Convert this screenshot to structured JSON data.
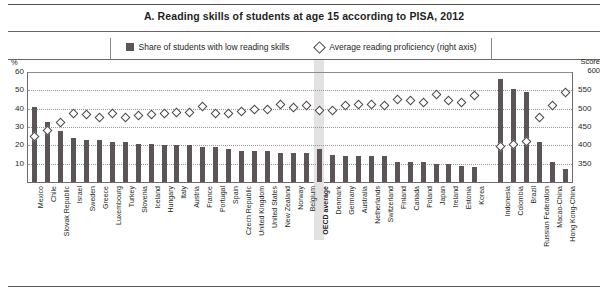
{
  "title": "A. Reading skills of students at age 15 according to PISA, 2012",
  "legend": {
    "bars_label": "Share of students with low reading skills",
    "markers_label": "Average reading proficiency (right axis)"
  },
  "axes": {
    "left_unit": "%",
    "right_unit_line1": "Score",
    "right_unit_line2": "600",
    "left_ticks": [
      "60",
      "50",
      "40",
      "30",
      "20",
      "10"
    ],
    "right_ticks": [
      "600",
      "550",
      "500",
      "450",
      "400",
      "350"
    ],
    "left_range": [
      0,
      60
    ],
    "right_range": [
      300,
      600
    ]
  },
  "colors": {
    "bar": "#5b5557",
    "marker_edge": "#4a4547",
    "marker_fill": "#ffffff",
    "grid": "#9b9698",
    "highlight_band": "#e3e1e2",
    "text": "#231f1e"
  },
  "chart_data": {
    "type": "bar",
    "title": "A. Reading skills of students at age 15 according to PISA, 2012",
    "xlabel": "",
    "ylabel": "%",
    "ylim": [
      0,
      60
    ],
    "y2label": "Score",
    "y2lim": [
      300,
      600
    ],
    "grid": true,
    "legend_position": "top",
    "highlight_category": "OECD average",
    "categories": [
      "Mexico",
      "Chile",
      "Slovak Republic",
      "Israel",
      "Sweden",
      "Greece",
      "Luxembourg",
      "Turkey",
      "Slovenia",
      "Iceland",
      "Hungary",
      "Italy",
      "Austria",
      "France",
      "Portugal",
      "Spain",
      "Czech Republic",
      "United Kingdom",
      "United States",
      "New Zealand",
      "Norway",
      "Belgium",
      "OECD average",
      "Denmark",
      "Germany",
      "Australia",
      "Netherlands",
      "Switzerland",
      "Finland",
      "Canada",
      "Poland",
      "Japan",
      "Ireland",
      "Estonia",
      "Korea",
      "",
      "Indonesia",
      "Colombia",
      "Brazil",
      "Russian Federation",
      "Macao-China",
      "Hong Kong-China"
    ],
    "series": [
      {
        "name": "Share of students with low reading skills",
        "type": "bar",
        "axis": "left",
        "values": [
          41,
          33,
          28,
          24,
          23,
          23,
          22,
          22,
          21,
          21,
          20,
          20,
          20,
          19,
          19,
          18,
          17,
          17,
          17,
          16,
          16,
          16,
          18,
          15,
          14,
          14,
          14,
          14,
          11,
          11,
          11,
          10,
          10,
          9,
          8,
          null,
          56,
          51,
          49,
          22,
          11,
          7
        ]
      },
      {
        "name": "Average reading proficiency (right axis)",
        "type": "scatter",
        "axis": "right",
        "values": [
          424,
          441,
          463,
          486,
          483,
          477,
          488,
          475,
          481,
          483,
          488,
          490,
          490,
          505,
          488,
          488,
          493,
          499,
          498,
          512,
          504,
          509,
          496,
          496,
          508,
          512,
          511,
          509,
          524,
          523,
          518,
          538,
          523,
          516,
          536,
          null,
          396,
          403,
          410,
          475,
          509,
          545
        ]
      }
    ]
  }
}
